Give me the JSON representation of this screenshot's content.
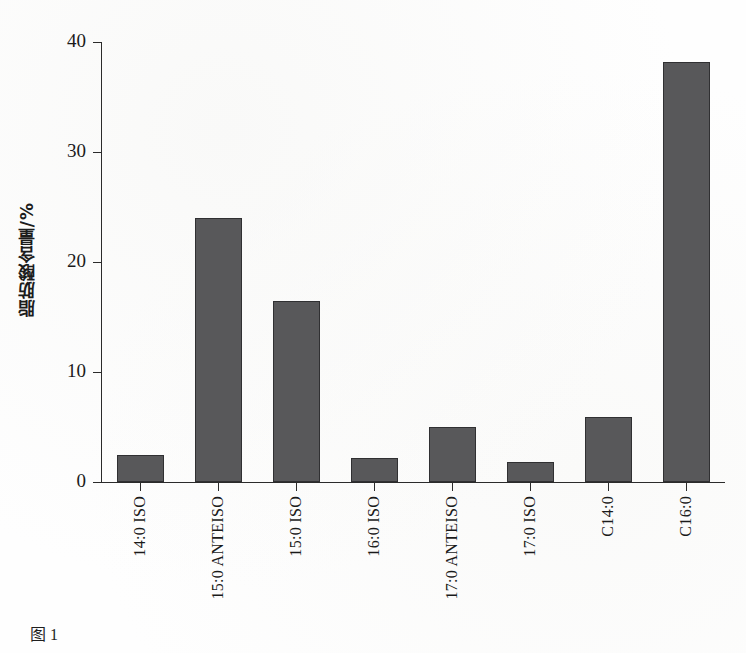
{
  "chart_data": {
    "type": "bar",
    "title": "",
    "subtitle": "",
    "xlabel": "",
    "ylabel": "脂肪酸含量/%",
    "ylim": [
      0,
      40
    ],
    "yticks": [
      0,
      10,
      20,
      30,
      40
    ],
    "ytick_labels": [
      "0",
      "10",
      "20",
      "30",
      "40"
    ],
    "grid": false,
    "legend": null,
    "legend_position": "none",
    "bar_color": "#58585a",
    "bar_edge_color": "#303032",
    "axis_color": "#2b2b2b",
    "background_color": "#ffffff",
    "categories": [
      "14:0 ISO",
      "15:0 ANTEISO",
      "15:0 ISO",
      "16:0 ISO",
      "17:0 ANTEISO",
      "17:0 ISO",
      "C14:0",
      "C16:0"
    ],
    "values": [
      2.5,
      24.0,
      16.5,
      2.2,
      5.0,
      1.8,
      5.9,
      38.2
    ],
    "series": [
      {
        "name": "脂肪酸含量",
        "values": [
          2.5,
          24.0,
          16.5,
          2.2,
          5.0,
          1.8,
          5.9,
          38.2
        ]
      }
    ]
  },
  "caption": {
    "text": "图 1"
  }
}
